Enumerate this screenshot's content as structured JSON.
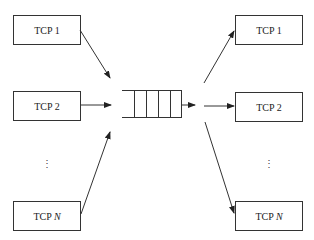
{
  "diagram": {
    "left_nodes": [
      {
        "label": "TCP 1",
        "prefix": "TCP ",
        "suffix": "1",
        "italic_suffix": false
      },
      {
        "label": "TCP 2",
        "prefix": "TCP ",
        "suffix": "2",
        "italic_suffix": false
      },
      {
        "label": "TCP N",
        "prefix": "TCP ",
        "suffix": "N",
        "italic_suffix": true
      }
    ],
    "right_nodes": [
      {
        "label": "TCP 1",
        "prefix": "TCP ",
        "suffix": "1",
        "italic_suffix": false
      },
      {
        "label": "TCP 2",
        "prefix": "TCP ",
        "suffix": "2",
        "italic_suffix": false
      },
      {
        "label": "TCP N",
        "prefix": "TCP ",
        "suffix": "N",
        "italic_suffix": true
      }
    ],
    "ellipsis": "⋮",
    "queue": {
      "slots": 5
    },
    "colors": {
      "stroke": "#333333",
      "background": "#ffffff"
    }
  }
}
